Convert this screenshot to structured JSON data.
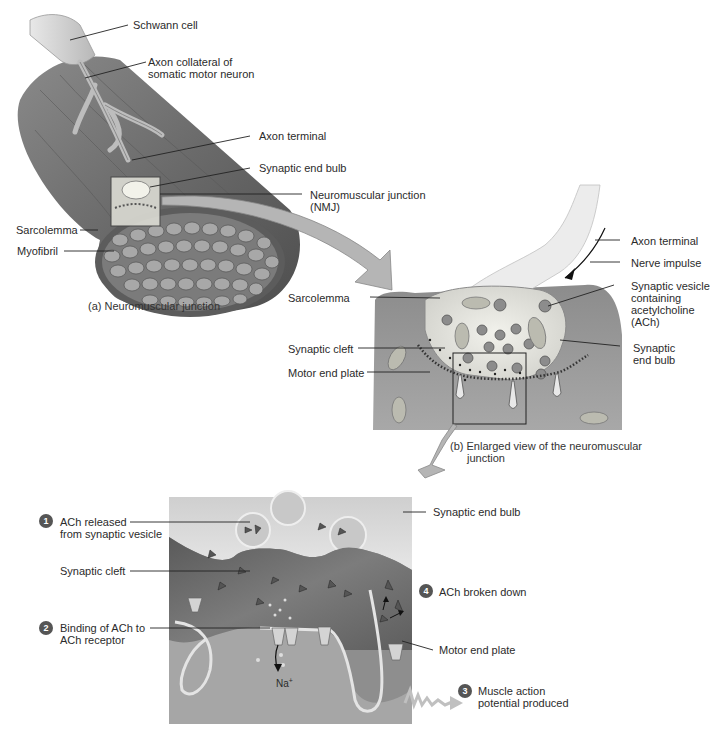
{
  "figure": {
    "panel_a": {
      "caption": "(a) Neuromuscular junction",
      "labels": {
        "schwann_cell": "Schwann cell",
        "axon_collateral_line1": "Axon collateral of",
        "axon_collateral_line2": "somatic motor neuron",
        "axon_terminal": "Axon terminal",
        "synaptic_end_bulb": "Synaptic end bulb",
        "nmj_line1": "Neuromuscular junction",
        "nmj_line2": "(NMJ)",
        "sarcolemma": "Sarcolemma",
        "myofibril": "Myofibril"
      }
    },
    "panel_b": {
      "caption_line1": "(b) Enlarged view of the neuromuscular",
      "caption_line2": "junction",
      "labels": {
        "axon_terminal": "Axon terminal",
        "nerve_impulse": "Nerve impulse",
        "vesicle_line1": "Synaptic vesicle",
        "vesicle_line2": "containing",
        "vesicle_line3": "acetylcholine",
        "vesicle_line4": "(ACh)",
        "sarcolemma": "Sarcolemma",
        "synaptic_end_bulb_line1": "Synaptic",
        "synaptic_end_bulb_line2": "end bulb",
        "synaptic_cleft": "Synaptic cleft",
        "motor_end_plate": "Motor end plate"
      }
    },
    "panel_c": {
      "labels": {
        "synaptic_end_bulb": "Synaptic end bulb",
        "synaptic_cleft": "Synaptic cleft",
        "motor_end_plate": "Motor end plate",
        "na_ion": "Na",
        "na_charge": "+"
      },
      "steps": [
        {
          "num": "1",
          "line1": "ACh released",
          "line2": "from synaptic vesicle"
        },
        {
          "num": "2",
          "line1": "Binding of ACh to",
          "line2": "ACh receptor"
        },
        {
          "num": "3",
          "line1": "Muscle action",
          "line2": "potential produced"
        },
        {
          "num": "4",
          "line1": "ACh broken down",
          "line2": ""
        }
      ]
    },
    "colors": {
      "background": "#ffffff",
      "tissue_dark": "#6e6e6e",
      "tissue_mid": "#9a9a9a",
      "tissue_light": "#d8d8d8",
      "arrow_fill": "#b5b5b5",
      "step_badge": "#555555",
      "leader_line": "#222222"
    }
  }
}
